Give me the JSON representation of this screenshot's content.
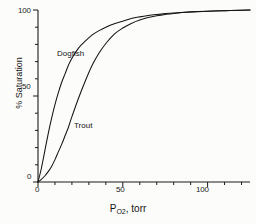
{
  "chart_data": {
    "type": "line",
    "title": "",
    "subtitle": "",
    "xlabel": "P_O2 , torr",
    "xlabel_parts": {
      "main": "P",
      "sub": "O",
      "sub2": "2",
      "rest": ", torr"
    },
    "ylabel": "% Saturation",
    "xlim": [
      0,
      125
    ],
    "ylim": [
      0,
      100
    ],
    "grid": false,
    "legend_position": "inline-annotations",
    "x_ticks_major": [
      0,
      50,
      100
    ],
    "x_tick_labels": [
      "0",
      "50",
      "100"
    ],
    "x_ticks_minor_step": 10,
    "y_ticks_major": [
      0,
      50,
      100
    ],
    "y_tick_labels": [
      "0",
      "50",
      "100"
    ],
    "y_ticks_minor_step": 10,
    "annotations": [
      {
        "text": "Dogfish",
        "x": 14,
        "y": 72
      },
      {
        "text": "Trout",
        "x": 25,
        "y": 30
      }
    ],
    "series": [
      {
        "name": "Dogfish",
        "shape": "hyperbolic",
        "x": [
          0,
          2,
          4,
          6,
          8,
          10,
          12,
          14,
          16,
          18,
          20,
          24,
          28,
          32,
          36,
          40,
          45,
          50,
          55,
          60,
          65,
          70,
          75,
          80,
          90,
          100,
          110,
          120,
          125
        ],
        "values": [
          0,
          8,
          18,
          28,
          37,
          45,
          52,
          58,
          63,
          68,
          72,
          78,
          82,
          85.5,
          88,
          90,
          92,
          93.5,
          95,
          96,
          96.8,
          97.4,
          97.9,
          98.3,
          98.9,
          99.3,
          99.6,
          99.9,
          100
        ]
      },
      {
        "name": "Trout",
        "shape": "sigmoid",
        "x": [
          0,
          2,
          4,
          6,
          8,
          10,
          12,
          14,
          16,
          18,
          20,
          24,
          28,
          32,
          36,
          40,
          45,
          50,
          55,
          60,
          65,
          70,
          75,
          80,
          90,
          100,
          110,
          120,
          125
        ],
        "values": [
          0,
          1.5,
          3.5,
          6,
          9,
          13,
          17.5,
          22,
          27,
          32,
          38,
          49,
          59,
          68,
          75,
          80.5,
          86,
          89.5,
          92.2,
          94.2,
          95.6,
          96.6,
          97.4,
          98,
          98.8,
          99.3,
          99.6,
          99.9,
          100
        ]
      }
    ],
    "colors": {
      "curve": "#1a1a1a",
      "axis": "#1a1a1a",
      "background": "#fcfcfb",
      "text": "#141414"
    }
  },
  "axes": {
    "y_top_label": "100",
    "y_mid_label": "50",
    "y_zero_label": "0",
    "x_zero_label": "0",
    "x_mid_label": "50",
    "x_high_label": "100",
    "y_title": "% Saturation",
    "x_title_main": "P",
    "x_title_sub_element": "O",
    "x_title_sub_number": "2",
    "x_title_rest": ", torr"
  },
  "curve_labels": {
    "dogfish": "Dogfish",
    "trout": "Trout"
  }
}
